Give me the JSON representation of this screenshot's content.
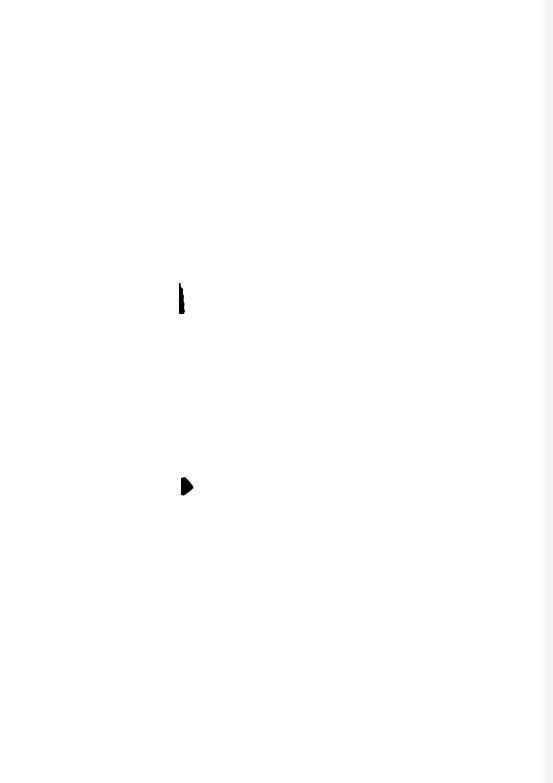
{
  "document": {
    "type": "blank-scanned-page",
    "background_color": "#ffffff",
    "ink_color": "#000000",
    "edge_shadow_color": "#eeeeee",
    "marks": [
      {
        "name": "vertical-bar-mark",
        "x": 178,
        "y": 283,
        "width": 8,
        "height": 31
      },
      {
        "name": "wedge-mark",
        "x": 181,
        "y": 477,
        "width": 13,
        "height": 19
      }
    ]
  }
}
